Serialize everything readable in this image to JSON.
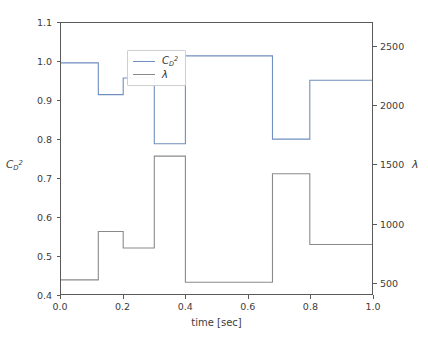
{
  "chart_data": {
    "type": "line",
    "title": "",
    "xlabel": "time [sec]",
    "ylabel_left": "C_D^2",
    "ylabel_right": "lambda",
    "ylabel_left_base": "C",
    "ylabel_left_sub": "D",
    "ylabel_left_sup": "2",
    "ylabel_right_glyph": "λ",
    "grid": false,
    "legend_position": "upper left",
    "xlim": [
      0.0,
      1.0
    ],
    "ylim_left": [
      0.4,
      1.1
    ],
    "ylim_right": [
      400,
      2700
    ],
    "xticks": [
      0.0,
      0.2,
      0.4,
      0.6,
      0.8,
      1.0
    ],
    "xtick_labels": [
      "0.0",
      "0.2",
      "0.4",
      "0.6",
      "0.8",
      "1.0"
    ],
    "yticks_left": [
      0.4,
      0.5,
      0.6,
      0.7,
      0.8,
      0.9,
      1.0,
      1.1
    ],
    "ytick_labels_left": [
      "0.4",
      "0.5",
      "0.6",
      "0.7",
      "0.8",
      "0.9",
      "1.0",
      "1.1"
    ],
    "yticks_right": [
      500,
      1000,
      1500,
      2000,
      2500
    ],
    "ytick_labels_right": [
      "500",
      "1000",
      "1500",
      "2000",
      "2500"
    ],
    "series": [
      {
        "name": "C_D^2",
        "axis": "left",
        "color": "#6f8fbf",
        "drawstyle": "steps-post",
        "x": [
          0.0,
          0.02,
          0.12,
          0.2,
          0.3,
          0.4,
          0.68,
          0.8,
          1.0
        ],
        "y": [
          0.997,
          0.997,
          0.915,
          0.958,
          0.788,
          1.015,
          0.8,
          0.952,
          0.952
        ]
      },
      {
        "name": "lambda",
        "axis": "right",
        "color": "#8a8a8a",
        "drawstyle": "steps-post",
        "x": [
          0.0,
          0.02,
          0.12,
          0.2,
          0.3,
          0.4,
          0.68,
          0.8,
          1.0
        ],
        "y": [
          520,
          520,
          930,
          790,
          1570,
          500,
          1420,
          820,
          820
        ]
      }
    ]
  },
  "legend": {
    "entries": [
      {
        "label_base": "C",
        "label_sub": "D",
        "label_sup": "2",
        "symbol": "line",
        "color": "#6f8fbf"
      },
      {
        "label_glyph": "λ",
        "symbol": "line",
        "color": "#8a8a8a"
      }
    ]
  }
}
